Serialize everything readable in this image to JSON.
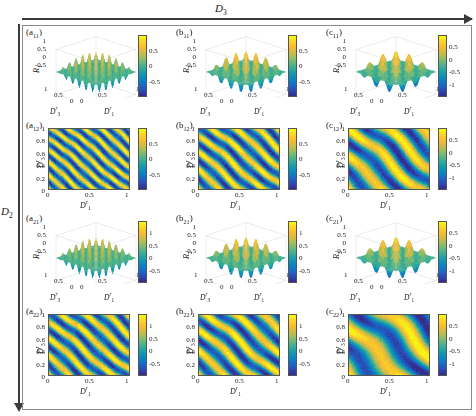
{
  "figure": {
    "axis_top_label": "D",
    "axis_top_sub": "3",
    "axis_left_label": "D",
    "axis_left_sub": "2",
    "background": "#ffffff",
    "frame_color": "#8a8a8a"
  },
  "ticks": {
    "zero": "0",
    "half": "0.5",
    "one": "1",
    "t02": "0.2",
    "t04": "0.4",
    "t06": "0.6",
    "t08": "0.8",
    "neg_half": "-0.5",
    "neg_one": "-1"
  },
  "labels": {
    "D1r": "D",
    "D1r_sup": "r",
    "D1r_sub": "1",
    "D3r": "D",
    "D3r_sup": "r",
    "D3r_sub": "3",
    "R1": "R",
    "R1_sub": "1",
    "R2": "R",
    "R2_sub": "2",
    "R3": "R",
    "R3_sub": "3"
  },
  "chart_data": {
    "type": "heatmap",
    "title": "",
    "xlabel": "D_1^r",
    "ylabel": "D_3^r",
    "xlim": [
      0,
      1
    ],
    "ylim": [
      0,
      1
    ],
    "grid": false,
    "legend": "colorbar right of each subpanel",
    "colormap": "parula",
    "panels": [
      {
        "tag": "a",
        "tag_sub": "11",
        "row": 1,
        "col": 1,
        "kind": "surface",
        "zlabel": "R",
        "zlabel_sub": "1",
        "xlabel": "D",
        "xlabel_sup": "r",
        "xlabel_sub": "3",
        "ylabel": "D",
        "ylabel_sup": "r",
        "ylabel_sub": "1",
        "z_ticks": [
          "1",
          "0.5",
          "0",
          "-0.5"
        ],
        "x_ticks": [
          "1",
          "0.5",
          "0"
        ],
        "y_ticks": [
          "0",
          "0.5",
          "1"
        ],
        "cbar_ticks": [
          "0.5",
          "0",
          "-0.5"
        ],
        "cbar_range": [
          -0.9,
          0.9
        ],
        "ripples_x": 6,
        "ripples_y": 6,
        "amp": 1.0
      },
      {
        "tag": "b",
        "tag_sub": "11",
        "row": 1,
        "col": 2,
        "kind": "surface",
        "zlabel": "R",
        "zlabel_sub": "2",
        "xlabel": "D",
        "xlabel_sup": "r",
        "xlabel_sub": "3",
        "ylabel": "D",
        "ylabel_sup": "r",
        "ylabel_sub": "1",
        "z_ticks": [
          "1",
          "0.5",
          "0",
          "-0.5"
        ],
        "x_ticks": [
          "1",
          "0.5",
          "0"
        ],
        "y_ticks": [
          "0",
          "0.5",
          "1"
        ],
        "cbar_ticks": [
          "0.5",
          "0",
          "-0.5"
        ],
        "cbar_range": [
          -0.9,
          0.9
        ],
        "ripples_x": 4,
        "ripples_y": 4,
        "amp": 1.0
      },
      {
        "tag": "c",
        "tag_sub": "11",
        "row": 1,
        "col": 3,
        "kind": "surface",
        "zlabel": "R",
        "zlabel_sub": "3",
        "xlabel": "D",
        "xlabel_sup": "r",
        "xlabel_sub": "3",
        "ylabel": "D",
        "ylabel_sup": "r",
        "ylabel_sub": "1",
        "z_ticks": [
          "1",
          "0.5",
          "0",
          "-0.5"
        ],
        "x_ticks": [
          "1",
          "0.5",
          "0"
        ],
        "y_ticks": [
          "0",
          "0.5",
          "1"
        ],
        "cbar_ticks": [
          "0.5",
          "0",
          "-0.5",
          "-1"
        ],
        "cbar_range": [
          -1.0,
          0.8
        ],
        "ripples_x": 3,
        "ripples_y": 3,
        "amp": 1.0
      },
      {
        "tag": "a",
        "tag_sub": "12",
        "row": 1,
        "col": 1,
        "kind": "heatmap",
        "ylabel": "D",
        "ylabel_sup": "r",
        "ylabel_sub": "3",
        "xlabel": "D",
        "xlabel_sup": "r",
        "xlabel_sub": "1",
        "y_ticks": [
          "1",
          "0.8",
          "0.6",
          "0.4",
          "0.2",
          "0"
        ],
        "x_ticks": [
          "0",
          "0.5",
          "1"
        ],
        "cbar_ticks": [
          "0.5",
          "0",
          "-0.5"
        ],
        "cbar_range": [
          -0.9,
          0.9
        ],
        "stripes": 7,
        "stripe_angle": 42,
        "noise": 0.16
      },
      {
        "tag": "b",
        "tag_sub": "12",
        "row": 1,
        "col": 2,
        "kind": "heatmap",
        "ylabel": "D",
        "ylabel_sup": "r",
        "ylabel_sub": "3",
        "xlabel": "D",
        "xlabel_sup": "r",
        "xlabel_sub": "1",
        "y_ticks": [
          "1",
          "0.8",
          "0.6",
          "0.4",
          "0.2",
          "0"
        ],
        "x_ticks": [
          "0",
          "0.5",
          "1"
        ],
        "cbar_ticks": [
          "0.5",
          "0",
          "-0.5"
        ],
        "cbar_range": [
          -0.9,
          0.9
        ],
        "stripes": 5,
        "stripe_angle": 42,
        "noise": 0.14
      },
      {
        "tag": "c",
        "tag_sub": "12",
        "row": 1,
        "col": 3,
        "kind": "heatmap",
        "ylabel": "D",
        "ylabel_sup": "r",
        "ylabel_sub": "3",
        "xlabel": "D",
        "xlabel_sup": "r",
        "xlabel_sub": "1",
        "y_ticks": [
          "1",
          "0.8",
          "0.6",
          "0.4",
          "0.2",
          "0"
        ],
        "x_ticks": [
          "0",
          "0.5",
          "1"
        ],
        "cbar_ticks": [
          "0.5",
          "0",
          "-0.5",
          "-1"
        ],
        "cbar_range": [
          -1.0,
          0.8
        ],
        "stripes": 3,
        "stripe_angle": 40,
        "noise": 0.12
      },
      {
        "tag": "a",
        "tag_sub": "21",
        "row": 2,
        "col": 1,
        "kind": "surface",
        "zlabel": "R",
        "zlabel_sub": "1",
        "xlabel": "D",
        "xlabel_sup": "r",
        "xlabel_sub": "3",
        "ylabel": "D",
        "ylabel_sup": "r",
        "ylabel_sub": "1",
        "z_ticks": [
          "1",
          "0.5",
          "0",
          "-0.5"
        ],
        "x_ticks": [
          "1",
          "0.5",
          "0"
        ],
        "y_ticks": [
          "0",
          "0.5",
          "1"
        ],
        "cbar_ticks": [
          "1",
          "0.5",
          "0",
          "-0.5"
        ],
        "cbar_range": [
          -0.8,
          1.0
        ],
        "ripples_x": 6,
        "ripples_y": 6,
        "amp": 1.0
      },
      {
        "tag": "b",
        "tag_sub": "21",
        "row": 2,
        "col": 2,
        "kind": "surface",
        "zlabel": "R",
        "zlabel_sub": "2",
        "xlabel": "D",
        "xlabel_sup": "r",
        "xlabel_sub": "3",
        "ylabel": "D",
        "ylabel_sup": "r",
        "ylabel_sub": "1",
        "z_ticks": [
          "1",
          "0.5",
          "0",
          "-0.5"
        ],
        "x_ticks": [
          "1",
          "0.5",
          "0"
        ],
        "y_ticks": [
          "0",
          "0.5",
          "1"
        ],
        "cbar_ticks": [
          "1",
          "0.5",
          "0",
          "-0.5"
        ],
        "cbar_range": [
          -0.8,
          1.0
        ],
        "ripples_x": 4,
        "ripples_y": 4,
        "amp": 1.0
      },
      {
        "tag": "c",
        "tag_sub": "21",
        "row": 2,
        "col": 3,
        "kind": "surface",
        "zlabel": "R",
        "zlabel_sub": "3",
        "xlabel": "D",
        "xlabel_sup": "r",
        "xlabel_sub": "3",
        "ylabel": "D",
        "ylabel_sup": "r",
        "ylabel_sub": "1",
        "z_ticks": [
          "1",
          "0.5",
          "0",
          "-0.5"
        ],
        "x_ticks": [
          "1",
          "0.5",
          "0"
        ],
        "y_ticks": [
          "0",
          "0.5",
          "1"
        ],
        "cbar_ticks": [
          "0.5",
          "0",
          "-0.5",
          "-1"
        ],
        "cbar_range": [
          -1.0,
          0.8
        ],
        "ripples_x": 3,
        "ripples_y": 3,
        "amp": 1.0
      },
      {
        "tag": "a",
        "tag_sub": "22",
        "row": 2,
        "col": 1,
        "kind": "heatmap",
        "ylabel": "D",
        "ylabel_sup": "r",
        "ylabel_sub": "3",
        "xlabel": "D",
        "xlabel_sup": "r",
        "xlabel_sub": "1",
        "y_ticks": [
          "1",
          "0.8",
          "0.6",
          "0.4",
          "0.2",
          "0"
        ],
        "x_ticks": [
          "0",
          "0.5",
          "1"
        ],
        "cbar_ticks": [
          "1",
          "0.5",
          "0",
          "-0.5"
        ],
        "cbar_range": [
          -0.8,
          1.0
        ],
        "stripes": 5,
        "stripe_angle": 42,
        "noise": 0.15
      },
      {
        "tag": "b",
        "tag_sub": "22",
        "row": 2,
        "col": 2,
        "kind": "heatmap",
        "ylabel": "D",
        "ylabel_sup": "r",
        "ylabel_sub": "3",
        "xlabel": "D",
        "xlabel_sup": "r",
        "xlabel_sub": "1",
        "y_ticks": [
          "1",
          "0.8",
          "0.6",
          "0.4",
          "0.2",
          "0"
        ],
        "x_ticks": [
          "0",
          "0.5",
          "1"
        ],
        "cbar_ticks": [
          "1",
          "0.5",
          "0",
          "-0.5"
        ],
        "cbar_range": [
          -0.8,
          1.0
        ],
        "stripes": 4,
        "stripe_angle": 42,
        "noise": 0.12
      },
      {
        "tag": "c",
        "tag_sub": "22",
        "row": 2,
        "col": 3,
        "kind": "heatmap",
        "ylabel": "D",
        "ylabel_sup": "r",
        "ylabel_sub": "3",
        "xlabel": "D",
        "xlabel_sup": "r",
        "xlabel_sub": "1",
        "y_ticks": [
          "1",
          "0.8",
          "0.6",
          "0.4",
          "0.2",
          "0"
        ],
        "x_ticks": [
          "0",
          "0.5",
          "1"
        ],
        "cbar_ticks": [
          "0.5",
          "0",
          "-0.5",
          "-1"
        ],
        "cbar_range": [
          -1.0,
          0.8
        ],
        "stripes": 2,
        "stripe_angle": 38,
        "noise": 0.1
      }
    ]
  }
}
